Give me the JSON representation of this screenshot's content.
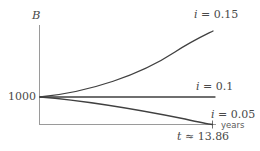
{
  "figure": {
    "name": "balance-vs-time-interest-curves",
    "background_color": "#ffffff",
    "line_color": "#404040",
    "axis_color": "#9a9a9a",
    "text_color": "#4a4a4a"
  },
  "axes": {
    "y_axis_label": "B",
    "x_axis_unit_label": "years",
    "y_tick_label": "1000"
  },
  "annotations": {
    "curve_high_label": "i = 0.15",
    "curve_mid_label": "i = 0.1",
    "curve_low_label": "i = 0.05",
    "zero_crossing_label": "t ≈ 13.86"
  },
  "chart_data": {
    "type": "line",
    "title": "",
    "xlabel": "years",
    "ylabel": "B",
    "xlim": [
      0,
      15
    ],
    "ylim": [
      0,
      3200
    ],
    "grid": false,
    "legend": "inline-right-of-each-curve",
    "y_ticks": [
      1000
    ],
    "y_tick_labels": [
      "1000"
    ],
    "x_ticks": [
      13.86
    ],
    "x_tick_labels": [
      "t ≈ 13.86"
    ],
    "initial_balance": 1000,
    "series": [
      {
        "name": "i = 0.15",
        "interest_rate": 0.15,
        "label": "i = 0.15",
        "x": [
          0,
          1.5,
          3,
          4.5,
          6,
          7.5,
          9,
          10.5,
          12,
          13.5,
          14.6
        ],
        "y": [
          1000,
          1120,
          1290,
          1510,
          1790,
          2120,
          2510,
          2960,
          3460,
          4030,
          4500
        ]
      },
      {
        "name": "i = 0.1",
        "interest_rate": 0.1,
        "label": "i = 0.1",
        "x": [
          0,
          2,
          4,
          6,
          8,
          10,
          12,
          14.6
        ],
        "y": [
          1000,
          1000,
          1000,
          1000,
          1000,
          1000,
          1000,
          1000
        ]
      },
      {
        "name": "i = 0.05",
        "interest_rate": 0.05,
        "label": "i = 0.05",
        "x": [
          0,
          2,
          4,
          6,
          8,
          10,
          12,
          13.86
        ],
        "y": [
          1000,
          890,
          760,
          620,
          460,
          290,
          110,
          0
        ]
      }
    ]
  }
}
